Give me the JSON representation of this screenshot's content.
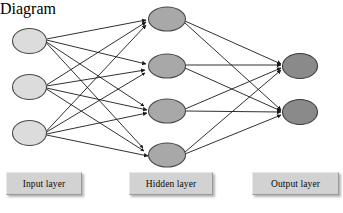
{
  "diagram": {
    "background_color": "#ffffff",
    "edge_color": "#1a1a1a",
    "node_stroke_color": "#4a4a4a",
    "layers": [
      {
        "id": "input",
        "name": "input-layer",
        "label": "Input layer",
        "node_count": 3,
        "fill_color": "#dcdcdc",
        "nodes": [
          {
            "id": "i1",
            "cx": 29.5,
            "cy": 41,
            "rx": 17,
            "ry": 12.5
          },
          {
            "id": "i2",
            "cx": 29.5,
            "cy": 87,
            "rx": 17,
            "ry": 12.5
          },
          {
            "id": "i3",
            "cx": 29.5,
            "cy": 133,
            "rx": 17,
            "ry": 12.5
          }
        ]
      },
      {
        "id": "hidden",
        "name": "hidden-layer",
        "label": "Hidden layer",
        "node_count": 4,
        "fill_color": "#a8a8a8",
        "nodes": [
          {
            "id": "h1",
            "cx": 167,
            "cy": 19,
            "rx": 18.5,
            "ry": 12
          },
          {
            "id": "h2",
            "cx": 167,
            "cy": 66,
            "rx": 18.5,
            "ry": 12
          },
          {
            "id": "h3",
            "cx": 167,
            "cy": 111,
            "rx": 18.5,
            "ry": 12
          },
          {
            "id": "h4",
            "cx": 167,
            "cy": 155,
            "rx": 18.5,
            "ry": 12
          }
        ]
      },
      {
        "id": "output",
        "name": "output-layer",
        "label": "Output layer",
        "node_count": 2,
        "fill_color": "#8a8a8a",
        "nodes": [
          {
            "id": "o1",
            "cx": 300,
            "cy": 66,
            "rx": 17.5,
            "ry": 12.5
          },
          {
            "id": "o2",
            "cx": 300,
            "cy": 112,
            "rx": 17.5,
            "ry": 12.5
          }
        ]
      }
    ],
    "connections": {
      "input_to_hidden": "fully-connected",
      "hidden_to_output": "fully-connected",
      "directed": true,
      "arrowhead": "filled-triangle"
    }
  }
}
